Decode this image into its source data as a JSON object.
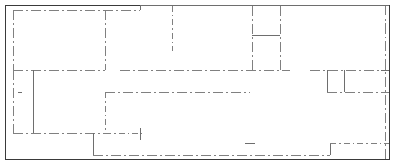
{
  "drawing": {
    "title": "floor-plan-line-drawing",
    "width": 395,
    "height": 166,
    "background_color": "#ffffff",
    "outline_color": "#3a3a3a",
    "interior_color": "#808080",
    "accent_color": "#6e6e6e",
    "outline_width": 1,
    "interior_width": 1,
    "dash_pattern": "10 3 2 3",
    "dash_pattern_short": "6 3 1.5 3",
    "outline": {
      "label": "outer-boundary",
      "x": 5.5,
      "y": 5.5,
      "width": 384,
      "height": 154
    },
    "segments": [
      {
        "name": "top-interior-wall-left",
        "style": "dashdot",
        "x1": 13,
        "y1": 10,
        "x2": 140,
        "y2": 10
      },
      {
        "name": "top-interior-jog-riser",
        "style": "solid",
        "x1": 140,
        "y1": 10,
        "x2": 140,
        "y2": 5.5
      },
      {
        "name": "top-interior-wall-right",
        "style": "solid",
        "x1": 140,
        "y1": 5.5,
        "x2": 389,
        "y2": 5.5
      },
      {
        "name": "left-interior-wall-upper",
        "style": "dashdot",
        "x1": 13,
        "y1": 10,
        "x2": 13,
        "y2": 70
      },
      {
        "name": "left-interior-wall-lower",
        "style": "dashdot",
        "x1": 13,
        "y1": 70,
        "x2": 13,
        "y2": 133
      },
      {
        "name": "vertical-partition-a",
        "style": "dashdot",
        "x1": 105,
        "y1": 10,
        "x2": 105,
        "y2": 70
      },
      {
        "name": "vertical-partition-b",
        "style": "dashdot",
        "x1": 172,
        "y1": 5.5,
        "x2": 172,
        "y2": 51
      },
      {
        "name": "vertical-partition-c",
        "style": "dashdot",
        "x1": 252,
        "y1": 5.5,
        "x2": 252,
        "y2": 70
      },
      {
        "name": "vertical-partition-d",
        "style": "dashdot",
        "x1": 280,
        "y1": 5.5,
        "x2": 280,
        "y2": 70
      },
      {
        "name": "room-divider-solid",
        "style": "solid",
        "x1": 252,
        "y1": 35,
        "x2": 280,
        "y2": 35
      },
      {
        "name": "right-inset-vertical",
        "style": "dashdot",
        "x1": 385,
        "y1": 5.5,
        "x2": 385,
        "y2": 159
      },
      {
        "name": "mid-horizontal-left",
        "style": "dashdot",
        "x1": 13,
        "y1": 70,
        "x2": 105,
        "y2": 70
      },
      {
        "name": "mid-horizontal-center",
        "style": "dashdot",
        "x1": 120,
        "y1": 70,
        "x2": 290,
        "y2": 70
      },
      {
        "name": "mid-horizontal-right",
        "style": "dashdot",
        "x1": 310,
        "y1": 70,
        "x2": 389,
        "y2": 70
      },
      {
        "name": "left-room-vertical",
        "style": "solid",
        "x1": 33,
        "y1": 70,
        "x2": 33,
        "y2": 133
      },
      {
        "name": "lower-horizontal-center",
        "style": "dashdot",
        "x1": 105,
        "y1": 92,
        "x2": 250,
        "y2": 92
      },
      {
        "name": "lower-horizontal-right",
        "style": "dashdot",
        "x1": 327,
        "y1": 92,
        "x2": 389,
        "y2": 92
      },
      {
        "name": "vertical-partition-e",
        "style": "dashdot",
        "x1": 105,
        "y1": 92,
        "x2": 105,
        "y2": 133
      },
      {
        "name": "closet-box-left",
        "style": "solid",
        "x1": 327,
        "y1": 70,
        "x2": 327,
        "y2": 92
      },
      {
        "name": "closet-box-right",
        "style": "solid",
        "x1": 344,
        "y1": 70,
        "x2": 344,
        "y2": 92
      },
      {
        "name": "bottom-horizontal-left",
        "style": "dashdot",
        "x1": 13,
        "y1": 133,
        "x2": 105,
        "y2": 133
      },
      {
        "name": "bottom-horizontal-mid",
        "style": "dashdot",
        "x1": 105,
        "y1": 133,
        "x2": 142,
        "y2": 133
      },
      {
        "name": "bottom-stub-vertical",
        "style": "solid",
        "x1": 140,
        "y1": 128,
        "x2": 140,
        "y2": 140
      },
      {
        "name": "vestibule-vertical",
        "style": "solid",
        "x1": 93,
        "y1": 133,
        "x2": 93,
        "y2": 155
      },
      {
        "name": "bottom-horizontal-run",
        "style": "dashdot",
        "x1": 93,
        "y1": 155,
        "x2": 330,
        "y2": 155
      },
      {
        "name": "bottom-right-vertical",
        "style": "solid",
        "x1": 330,
        "y1": 143,
        "x2": 330,
        "y2": 155
      },
      {
        "name": "bottom-right-horizontal",
        "style": "dashdot",
        "x1": 330,
        "y1": 143,
        "x2": 389,
        "y2": 143
      },
      {
        "name": "bottom-tick-mark",
        "style": "solid",
        "x1": 245,
        "y1": 143,
        "x2": 255,
        "y2": 143
      },
      {
        "name": "left-tick-mark",
        "style": "solid",
        "x1": 18,
        "y1": 92,
        "x2": 22,
        "y2": 92
      },
      {
        "name": "right-edge-tick",
        "style": "solid",
        "x1": 381,
        "y1": 70,
        "x2": 389,
        "y2": 70
      }
    ]
  }
}
